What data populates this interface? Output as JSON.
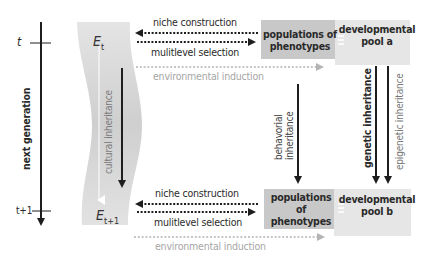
{
  "timeline": {
    "t_label": "t",
    "t1_label": "t+1",
    "axis_label": "next generation"
  },
  "environment": {
    "top_label": "E",
    "top_sub": "t",
    "bottom_label": "E",
    "bottom_sub": "t+1",
    "cultural_label": "cultural inheritance"
  },
  "top_row": {
    "niche_construction": "niche construction",
    "multilevel_selection": "mulitlevel selection",
    "environmental_induction": "environmental induction",
    "phenotypes_box": [
      "populations of",
      "phenotypes"
    ],
    "pool_box": [
      "developmental",
      "pool a"
    ]
  },
  "bottom_row": {
    "niche_construction": "niche construction",
    "multilevel_selection": "mulitlevel selection",
    "environmental_induction": "environmental induction",
    "phenotypes_box": [
      "populations of",
      "phenotypes"
    ],
    "pool_box": [
      "developmental",
      "pool b"
    ]
  },
  "vertical_arrows": {
    "behavioral": [
      "behavorial",
      "inheritance"
    ],
    "genetic": "genetic inheritance",
    "epigenetic": "epigenetic inheritance"
  },
  "colors": {
    "env_band": "#dcdcdc",
    "phenotypes_box": "#c8c8c8",
    "pool_box": "#e6e6e6",
    "arrow_dark": "#1e1e1e",
    "arrow_light": "#b4b4b4"
  }
}
